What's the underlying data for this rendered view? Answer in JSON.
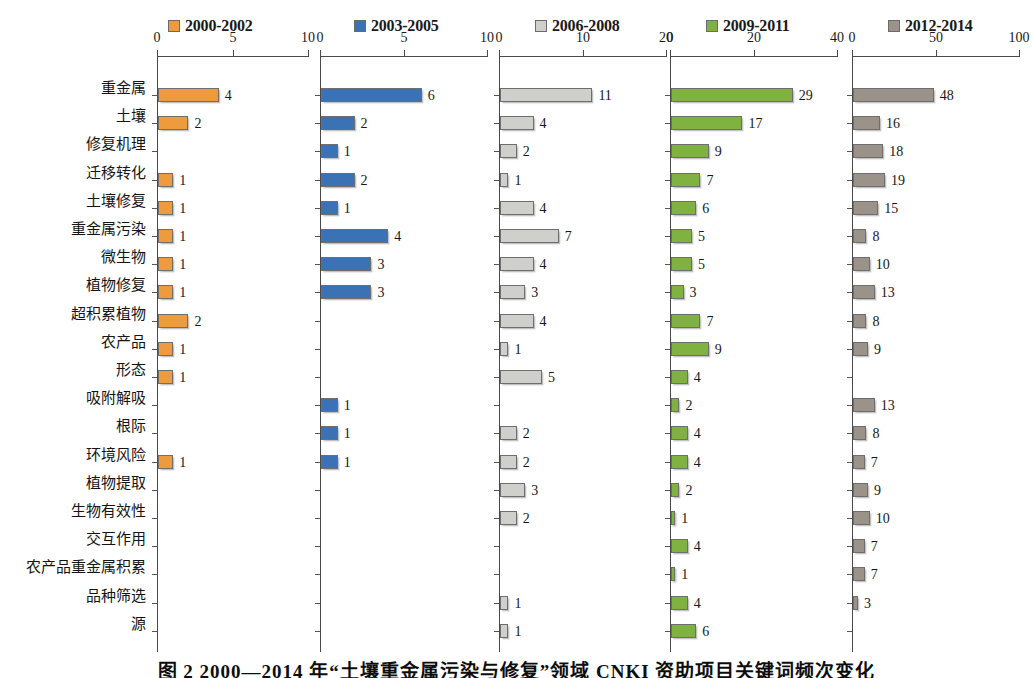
{
  "legend": {
    "items": [
      {
        "label": "2000-2002",
        "color": "#ED9B3C",
        "x": 168
      },
      {
        "label": "2003-2005",
        "color": "#3B72B5",
        "x": 354
      },
      {
        "label": "2006-2008",
        "color": "#CFCFCB",
        "x": 535
      },
      {
        "label": "2009-2011",
        "color": "#7FB241",
        "x": 706
      },
      {
        "label": "2012-2014",
        "color": "#9B9389",
        "x": 888
      }
    ]
  },
  "caption": {
    "text": "图 2 2000—2014 年“土壤重金属污染与修复”领域 CNKI 资助项目关键词频次变化"
  },
  "chart_data": {
    "type": "bar",
    "title": "",
    "xlabel": "",
    "ylabel": "",
    "layout": "small-multiples-horizontal-bar",
    "grid": false,
    "legend_position": "top",
    "categories": [
      "重金属",
      "土壤",
      "修复机理",
      "迁移转化",
      "土壤修复",
      "重金属污染",
      "微生物",
      "植物修复",
      "超积累植物",
      "农产品",
      "形态",
      "吸附解吸",
      "根际",
      "环境风险",
      "植物提取",
      "生物有效性",
      "交互作用",
      "农产品重金属积累",
      "品种筛选",
      "源"
    ],
    "panels": [
      {
        "name": "2000-2002",
        "color": "#ED9B3C",
        "xlim": [
          0,
          10
        ],
        "ticks": [
          0,
          5,
          10
        ],
        "ticklabels": [
          "0",
          "5",
          "10"
        ],
        "values": [
          4,
          2,
          null,
          1,
          1,
          1,
          1,
          1,
          2,
          1,
          1,
          null,
          null,
          1,
          null,
          null,
          null,
          null,
          null,
          null
        ]
      },
      {
        "name": "2003-2005",
        "color": "#3B72B5",
        "xlim": [
          0,
          10
        ],
        "ticks": [
          0,
          5,
          10
        ],
        "ticklabels": [
          "0",
          "5",
          "10"
        ],
        "values": [
          6,
          2,
          1,
          2,
          1,
          4,
          3,
          3,
          null,
          null,
          null,
          1,
          1,
          1,
          null,
          null,
          null,
          null,
          null,
          null
        ]
      },
      {
        "name": "2006-2008",
        "color": "#CFCFCB",
        "xlim": [
          0,
          20
        ],
        "ticks": [
          0,
          10,
          20
        ],
        "ticklabels": [
          "0",
          "10",
          "20"
        ],
        "values": [
          11,
          4,
          2,
          1,
          4,
          7,
          4,
          3,
          4,
          1,
          5,
          null,
          2,
          2,
          3,
          2,
          null,
          null,
          1,
          1
        ]
      },
      {
        "name": "2009-2011",
        "color": "#7FB241",
        "xlim": [
          0,
          40
        ],
        "ticks": [
          0,
          20,
          40
        ],
        "ticklabels": [
          "0",
          "20",
          "40"
        ],
        "values": [
          29,
          17,
          9,
          7,
          6,
          5,
          5,
          3,
          7,
          9,
          4,
          2,
          4,
          4,
          2,
          1,
          4,
          1,
          4,
          6
        ]
      },
      {
        "name": "2012-2014",
        "color": "#9B9389",
        "xlim": [
          0,
          100
        ],
        "ticks": [
          0,
          50,
          100
        ],
        "ticklabels": [
          "0",
          "50",
          "100"
        ],
        "values": [
          48,
          16,
          18,
          19,
          15,
          8,
          10,
          13,
          8,
          9,
          null,
          13,
          8,
          7,
          9,
          10,
          7,
          7,
          3,
          null
        ]
      }
    ]
  },
  "geometry": {
    "row0_y": 46,
    "row_step": 28.2,
    "panel_left": [
      157,
      320,
      499,
      670,
      852
    ],
    "panel_width": [
      152,
      168,
      168,
      168,
      168
    ]
  }
}
